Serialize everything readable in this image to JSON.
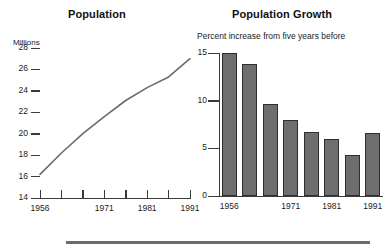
{
  "figure": {
    "bottom_rule": true
  },
  "left_panel": {
    "title": "Population",
    "units_label": "Millions"
  },
  "right_panel": {
    "title": "Population Growth",
    "subtitle": "Percent increase from five years before"
  },
  "chart_data": [
    {
      "type": "line",
      "title": "Population",
      "xlabel": "",
      "ylabel": "Millions",
      "ylim": [
        14,
        28
      ],
      "yticks": [
        14,
        16,
        18,
        20,
        22,
        24,
        26,
        28
      ],
      "ytick_labels": [
        "14",
        "16",
        "18",
        "20",
        "22",
        "24",
        "26",
        "28"
      ],
      "xlim": [
        1956,
        1991
      ],
      "xticks": [
        1956,
        1961,
        1966,
        1971,
        1976,
        1981,
        1986,
        1991
      ],
      "xtick_labels": [
        "1956",
        "",
        "",
        "1971",
        "",
        "1981",
        "",
        "1991"
      ],
      "x": [
        1956,
        1961,
        1966,
        1971,
        1976,
        1981,
        1986,
        1991
      ],
      "values": [
        16.2,
        18.2,
        20.0,
        21.6,
        23.1,
        24.3,
        25.3,
        27.0
      ],
      "grid": false,
      "legend": "none",
      "line_color": "#6b6b6b"
    },
    {
      "type": "bar",
      "title": "Population Growth",
      "subtitle": "Percent increase from five years before",
      "xlabel": "",
      "ylabel": "",
      "ylim": [
        0,
        15
      ],
      "yticks": [
        0,
        5,
        10,
        15
      ],
      "ytick_labels": [
        "0",
        "5",
        "10",
        "15"
      ],
      "categories": [
        "1956",
        "1961",
        "1966",
        "1971",
        "1976",
        "1981",
        "1986",
        "1991"
      ],
      "xtick_labels": [
        "1956",
        "",
        "",
        "1971",
        "",
        "1981",
        "",
        "1991"
      ],
      "values": [
        15.0,
        13.8,
        9.7,
        8.0,
        6.7,
        6.0,
        4.3,
        6.6
      ],
      "grid": false,
      "legend": "none",
      "bar_color": "#6e6e6e",
      "bar_edge_color": "#2e2e2e"
    }
  ]
}
